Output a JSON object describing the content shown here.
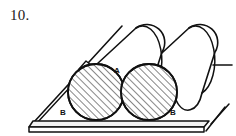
{
  "figure": {
    "problem_number": "10.",
    "caption_label_a": "A",
    "caption_label_b_left": "B",
    "caption_label_b_right": "B",
    "stroke_color": "#111111",
    "background_color": "#ffffff",
    "hatch_color": "#222222",
    "board_face_color": "#f2f2f2",
    "cylinder_face_color": "#ffffff"
  },
  "diagram_data": {
    "type": "line-drawing",
    "description": "Engineering statics figure: two identical cylinders lying side by side on an inclined plane that rests on a horizontal board. Contact point A is between the two cylinders; contact points B are where each cylinder touches the board.",
    "elements": [
      {
        "name": "horizontal-board",
        "kind": "plank",
        "note": "Flat board drawn in perspective with a thin visible front edge, broken off at right"
      },
      {
        "name": "inclined-plane",
        "kind": "ramp-edge",
        "note": "Diagonal line rising from lower-left to upper-right with a small flange notch"
      },
      {
        "name": "cylinder-front",
        "kind": "cylinder",
        "label": "B",
        "note": "Near cylinder, circular end face hatched with parallel diagonal lines"
      },
      {
        "name": "cylinder-rear",
        "kind": "cylinder",
        "label": "B",
        "note": "Far cylinder, circular end face hatched with parallel diagonal lines"
      },
      {
        "name": "contact-point-a",
        "kind": "label",
        "label": "A",
        "note": "Point where the two cylinders touch each other"
      }
    ],
    "labels": [
      {
        "text": "A",
        "x": 118,
        "y": 70,
        "role": "cylinder-to-cylinder-contact"
      },
      {
        "text": "B",
        "x": 64,
        "y": 112,
        "role": "left-cylinder-board-contact"
      },
      {
        "text": "B",
        "x": 172,
        "y": 112,
        "role": "right-cylinder-board-contact"
      }
    ]
  }
}
